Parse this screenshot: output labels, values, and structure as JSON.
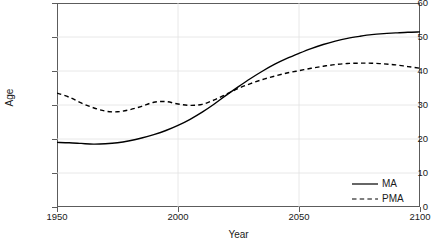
{
  "chart_data": {
    "type": "line",
    "title": "",
    "xlabel": "Year",
    "ylabel": "Age",
    "xlim": [
      1950,
      2100
    ],
    "ylim": [
      0,
      60
    ],
    "xticks": [
      1950,
      2000,
      2050,
      2100
    ],
    "yticks": [
      0,
      10,
      20,
      30,
      40,
      50,
      60
    ],
    "grid": true,
    "legend_position": "bottom-right",
    "x": [
      1950,
      1955,
      1960,
      1965,
      1970,
      1975,
      1980,
      1985,
      1990,
      1995,
      2000,
      2005,
      2010,
      2015,
      2020,
      2025,
      2030,
      2035,
      2040,
      2045,
      2050,
      2055,
      2060,
      2065,
      2070,
      2075,
      2080,
      2085,
      2090,
      2095,
      2100
    ],
    "series": [
      {
        "name": "MA",
        "style": "solid",
        "color": "#000000",
        "values": [
          19.0,
          18.9,
          18.7,
          18.5,
          18.6,
          18.9,
          19.5,
          20.3,
          21.3,
          22.5,
          24.0,
          25.8,
          27.9,
          30.3,
          32.9,
          35.4,
          37.8,
          40.0,
          42.0,
          43.7,
          45.2,
          46.6,
          47.8,
          48.8,
          49.6,
          50.2,
          50.7,
          51.0,
          51.2,
          51.4,
          51.5
        ]
      },
      {
        "name": "PMA",
        "style": "dashed",
        "color": "#000000",
        "values": [
          33.5,
          32.3,
          30.6,
          29.2,
          28.2,
          28.0,
          28.6,
          29.6,
          30.8,
          31.0,
          30.3,
          29.9,
          30.2,
          31.5,
          33.2,
          34.9,
          36.3,
          37.5,
          38.5,
          39.4,
          40.1,
          40.8,
          41.4,
          41.9,
          42.2,
          42.3,
          42.3,
          42.1,
          41.8,
          41.3,
          40.8
        ]
      }
    ]
  },
  "legend": {
    "items": [
      {
        "label": "MA",
        "style": "solid"
      },
      {
        "label": "PMA",
        "style": "dashed"
      }
    ]
  }
}
